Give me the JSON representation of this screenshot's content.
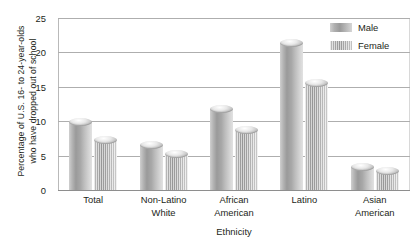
{
  "chart_data": {
    "type": "bar",
    "title": "",
    "subtitle": "",
    "xlabel": "Ethnicity",
    "ylabel": "Percentage of U.S. 16- to 24-year-olds who have dropped out of school",
    "ylabel_line1": "Percentage of U.S. 16- to 24-year-olds",
    "ylabel_line2": "who have dropped out of school",
    "categories": [
      "Total",
      "Non-Latino White",
      "African American",
      "Latino",
      "Asian American"
    ],
    "category_lines": [
      [
        "Total"
      ],
      [
        "Non-Latino",
        "White"
      ],
      [
        "African",
        "American"
      ],
      [
        "Latino"
      ],
      [
        "Asian",
        "American"
      ]
    ],
    "series": [
      {
        "name": "Male",
        "values": [
          9.9,
          6.5,
          11.8,
          21.4,
          3.4
        ]
      },
      {
        "name": "Female",
        "values": [
          7.3,
          5.2,
          8.7,
          15.5,
          2.8
        ]
      }
    ],
    "ylim": [
      0,
      25
    ],
    "yticks": [
      0,
      5,
      10,
      15,
      20,
      25
    ],
    "ytick_labels": [
      "0",
      "5",
      "10",
      "15",
      "20",
      "25"
    ],
    "grid": true,
    "grid_axis": "y",
    "legend_position": "top-right",
    "legend": [
      "Male",
      "Female"
    ],
    "colors": {
      "male": "#a8a8a8",
      "female": "#b0b0b0",
      "gridline": "#aeaeae",
      "axis": "#8e8e8e",
      "text": "#231f20",
      "background": "#ffffff"
    }
  }
}
